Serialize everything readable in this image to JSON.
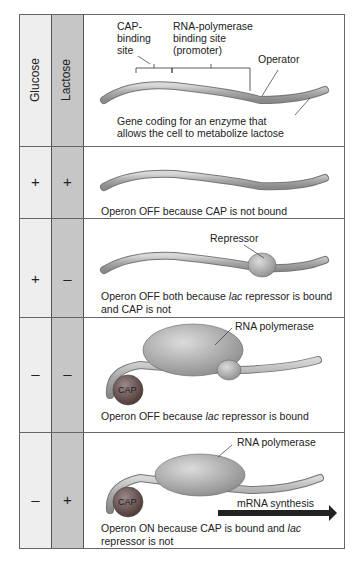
{
  "headers": {
    "glucose": "Glucose",
    "lactose": "Lactose"
  },
  "diagram_labels": {
    "cap_site": [
      "CAP-",
      "binding",
      "site"
    ],
    "promoter": [
      "RNA-polymerase",
      "binding site",
      "(promoter)"
    ],
    "operator": "Operator",
    "gene": [
      "Gene coding for an enzyme that",
      "allows the cell to metabolize lactose"
    ],
    "repressor": "Repressor",
    "rna_pol": "RNA polymerase",
    "cap": "CAP",
    "mrna": "mRNA synthesis"
  },
  "rows": [
    {
      "glucose": "+",
      "lactose": "+",
      "caption": "Operon OFF because CAP is not bound"
    },
    {
      "glucose": "+",
      "lactose": "–",
      "caption_parts": [
        "Operon OFF both because ",
        "lac",
        " repressor is bound and CAP is not"
      ]
    },
    {
      "glucose": "–",
      "lactose": "–",
      "caption_parts": [
        "Operon OFF because ",
        "lac",
        " repressor is bound"
      ]
    },
    {
      "glucose": "–",
      "lactose": "+",
      "caption_parts": [
        "Operon ON because CAP is bound and ",
        "lac",
        " repressor is not"
      ]
    }
  ],
  "colors": {
    "glucose_col": "#eeeeee",
    "lactose_col": "#c6c6c6",
    "dna": "#a9a9a9",
    "protein": "#b5b5b5",
    "cap": "#7a5a55",
    "arrow": "#222222"
  }
}
